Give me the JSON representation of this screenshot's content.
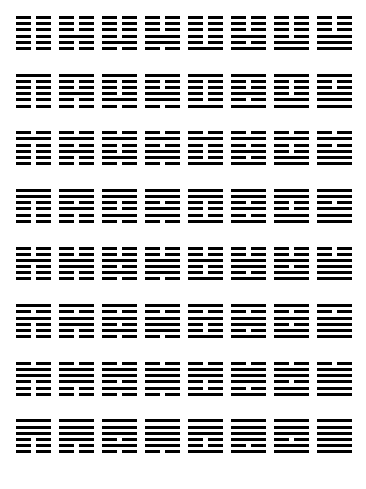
{
  "diagram": {
    "type": "hexagram-grid",
    "rows": 8,
    "columns": 8,
    "line_color": "#000000",
    "background_color": "#ffffff",
    "legend": {
      "yang": "solid line",
      "yin": "broken line"
    },
    "line_order_note": "Each hexagram is drawn top line first; 1 = solid (yang), 0 = broken (yin)."
  },
  "chart_data": {
    "type": "heatmap",
    "xlabel": "",
    "ylabel": "",
    "grid": false,
    "legend": "none",
    "categories": [],
    "hexagrams": [
      [
        {
          "lines": [
            0,
            0,
            0,
            0,
            0,
            0
          ],
          "upper": "Kun",
          "lower": "Kun"
        },
        {
          "lines": [
            0,
            0,
            0,
            1,
            0,
            0
          ],
          "upper": "Kun",
          "lower": "Kan"
        },
        {
          "lines": [
            0,
            0,
            0,
            0,
            1,
            0
          ],
          "upper": "Kun",
          "lower": "Gen"
        },
        {
          "lines": [
            0,
            0,
            0,
            1,
            1,
            0
          ],
          "upper": "Kun",
          "lower": "Xun"
        },
        {
          "lines": [
            0,
            0,
            0,
            0,
            0,
            1
          ],
          "upper": "Kun",
          "lower": "Zhen"
        },
        {
          "lines": [
            0,
            0,
            0,
            1,
            0,
            1
          ],
          "upper": "Kun",
          "lower": "Li"
        },
        {
          "lines": [
            0,
            0,
            0,
            0,
            1,
            1
          ],
          "upper": "Kun",
          "lower": "Dui"
        },
        {
          "lines": [
            0,
            0,
            0,
            1,
            1,
            1
          ],
          "upper": "Kun",
          "lower": "Qian"
        }
      ],
      [
        {
          "lines": [
            1,
            0,
            0,
            0,
            0,
            0
          ],
          "upper": "Kan",
          "lower": "Kun"
        },
        {
          "lines": [
            1,
            0,
            0,
            1,
            0,
            0
          ],
          "upper": "Kan",
          "lower": "Kan"
        },
        {
          "lines": [
            1,
            0,
            0,
            0,
            1,
            0
          ],
          "upper": "Kan",
          "lower": "Gen"
        },
        {
          "lines": [
            1,
            0,
            0,
            1,
            1,
            0
          ],
          "upper": "Kan",
          "lower": "Xun"
        },
        {
          "lines": [
            1,
            0,
            0,
            0,
            0,
            1
          ],
          "upper": "Kan",
          "lower": "Zhen"
        },
        {
          "lines": [
            1,
            0,
            0,
            1,
            0,
            1
          ],
          "upper": "Kan",
          "lower": "Li"
        },
        {
          "lines": [
            1,
            0,
            0,
            0,
            1,
            1
          ],
          "upper": "Kan",
          "lower": "Dui"
        },
        {
          "lines": [
            1,
            0,
            0,
            1,
            1,
            1
          ],
          "upper": "Kan",
          "lower": "Qian"
        }
      ],
      [
        {
          "lines": [
            0,
            1,
            0,
            0,
            0,
            0
          ],
          "upper": "Gen",
          "lower": "Kun"
        },
        {
          "lines": [
            0,
            1,
            0,
            1,
            0,
            0
          ],
          "upper": "Gen",
          "lower": "Kan"
        },
        {
          "lines": [
            0,
            1,
            0,
            0,
            1,
            0
          ],
          "upper": "Gen",
          "lower": "Gen"
        },
        {
          "lines": [
            0,
            1,
            0,
            1,
            1,
            0
          ],
          "upper": "Gen",
          "lower": "Xun"
        },
        {
          "lines": [
            0,
            1,
            0,
            0,
            0,
            1
          ],
          "upper": "Gen",
          "lower": "Zhen"
        },
        {
          "lines": [
            0,
            1,
            0,
            1,
            0,
            1
          ],
          "upper": "Gen",
          "lower": "Li"
        },
        {
          "lines": [
            0,
            1,
            0,
            0,
            1,
            1
          ],
          "upper": "Gen",
          "lower": "Dui"
        },
        {
          "lines": [
            0,
            1,
            0,
            1,
            1,
            1
          ],
          "upper": "Gen",
          "lower": "Qian"
        }
      ],
      [
        {
          "lines": [
            1,
            1,
            0,
            0,
            0,
            0
          ],
          "upper": "Xun",
          "lower": "Kun"
        },
        {
          "lines": [
            1,
            1,
            0,
            1,
            0,
            0
          ],
          "upper": "Xun",
          "lower": "Kan"
        },
        {
          "lines": [
            1,
            1,
            0,
            0,
            1,
            0
          ],
          "upper": "Xun",
          "lower": "Gen"
        },
        {
          "lines": [
            1,
            1,
            0,
            1,
            1,
            0
          ],
          "upper": "Xun",
          "lower": "Xun"
        },
        {
          "lines": [
            1,
            1,
            0,
            0,
            0,
            1
          ],
          "upper": "Xun",
          "lower": "Zhen"
        },
        {
          "lines": [
            1,
            1,
            0,
            1,
            0,
            1
          ],
          "upper": "Xun",
          "lower": "Li"
        },
        {
          "lines": [
            1,
            1,
            0,
            0,
            1,
            1
          ],
          "upper": "Xun",
          "lower": "Dui"
        },
        {
          "lines": [
            1,
            1,
            0,
            1,
            1,
            1
          ],
          "upper": "Xun",
          "lower": "Qian"
        }
      ],
      [
        {
          "lines": [
            0,
            0,
            1,
            0,
            0,
            0
          ],
          "upper": "Zhen",
          "lower": "Kun"
        },
        {
          "lines": [
            0,
            0,
            1,
            1,
            0,
            0
          ],
          "upper": "Zhen",
          "lower": "Kan"
        },
        {
          "lines": [
            0,
            0,
            1,
            0,
            1,
            0
          ],
          "upper": "Zhen",
          "lower": "Gen"
        },
        {
          "lines": [
            0,
            0,
            1,
            1,
            1,
            0
          ],
          "upper": "Zhen",
          "lower": "Xun"
        },
        {
          "lines": [
            0,
            0,
            1,
            0,
            0,
            1
          ],
          "upper": "Zhen",
          "lower": "Zhen"
        },
        {
          "lines": [
            0,
            0,
            1,
            1,
            0,
            1
          ],
          "upper": "Zhen",
          "lower": "Li"
        },
        {
          "lines": [
            0,
            0,
            1,
            0,
            1,
            1
          ],
          "upper": "Zhen",
          "lower": "Dui"
        },
        {
          "lines": [
            0,
            0,
            1,
            1,
            1,
            1
          ],
          "upper": "Zhen",
          "lower": "Qian"
        }
      ],
      [
        {
          "lines": [
            1,
            0,
            1,
            0,
            0,
            0
          ],
          "upper": "Li",
          "lower": "Kun"
        },
        {
          "lines": [
            1,
            0,
            1,
            1,
            0,
            0
          ],
          "upper": "Li",
          "lower": "Kan"
        },
        {
          "lines": [
            1,
            0,
            1,
            0,
            1,
            0
          ],
          "upper": "Li",
          "lower": "Gen"
        },
        {
          "lines": [
            1,
            0,
            1,
            1,
            1,
            0
          ],
          "upper": "Li",
          "lower": "Xun"
        },
        {
          "lines": [
            1,
            0,
            1,
            0,
            0,
            1
          ],
          "upper": "Li",
          "lower": "Zhen"
        },
        {
          "lines": [
            1,
            0,
            1,
            1,
            0,
            1
          ],
          "upper": "Li",
          "lower": "Li"
        },
        {
          "lines": [
            1,
            0,
            1,
            0,
            1,
            1
          ],
          "upper": "Li",
          "lower": "Dui"
        },
        {
          "lines": [
            1,
            0,
            1,
            1,
            1,
            1
          ],
          "upper": "Li",
          "lower": "Qian"
        }
      ],
      [
        {
          "lines": [
            0,
            1,
            1,
            0,
            0,
            0
          ],
          "upper": "Dui",
          "lower": "Kun"
        },
        {
          "lines": [
            0,
            1,
            1,
            1,
            0,
            0
          ],
          "upper": "Dui",
          "lower": "Kan"
        },
        {
          "lines": [
            0,
            1,
            1,
            0,
            1,
            0
          ],
          "upper": "Dui",
          "lower": "Gen"
        },
        {
          "lines": [
            0,
            1,
            1,
            1,
            1,
            0
          ],
          "upper": "Dui",
          "lower": "Xun"
        },
        {
          "lines": [
            0,
            1,
            1,
            0,
            0,
            1
          ],
          "upper": "Dui",
          "lower": "Zhen"
        },
        {
          "lines": [
            0,
            1,
            1,
            1,
            0,
            1
          ],
          "upper": "Dui",
          "lower": "Li"
        },
        {
          "lines": [
            0,
            1,
            1,
            0,
            1,
            1
          ],
          "upper": "Dui",
          "lower": "Dui"
        },
        {
          "lines": [
            0,
            1,
            1,
            1,
            1,
            1
          ],
          "upper": "Dui",
          "lower": "Qian"
        }
      ],
      [
        {
          "lines": [
            1,
            1,
            1,
            0,
            0,
            0
          ],
          "upper": "Qian",
          "lower": "Kun"
        },
        {
          "lines": [
            1,
            1,
            1,
            1,
            0,
            0
          ],
          "upper": "Qian",
          "lower": "Kan"
        },
        {
          "lines": [
            1,
            1,
            1,
            0,
            1,
            0
          ],
          "upper": "Qian",
          "lower": "Gen"
        },
        {
          "lines": [
            1,
            1,
            1,
            1,
            1,
            0
          ],
          "upper": "Qian",
          "lower": "Xun"
        },
        {
          "lines": [
            1,
            1,
            1,
            0,
            0,
            1
          ],
          "upper": "Qian",
          "lower": "Zhen"
        },
        {
          "lines": [
            1,
            1,
            1,
            1,
            0,
            1
          ],
          "upper": "Qian",
          "lower": "Li"
        },
        {
          "lines": [
            1,
            1,
            1,
            0,
            1,
            1
          ],
          "upper": "Qian",
          "lower": "Dui"
        },
        {
          "lines": [
            1,
            1,
            1,
            1,
            1,
            1
          ],
          "upper": "Qian",
          "lower": "Qian"
        }
      ]
    ]
  }
}
